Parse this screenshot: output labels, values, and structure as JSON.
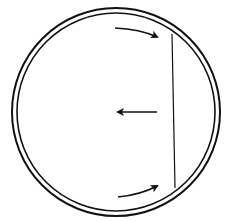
{
  "diagram": {
    "colors": {
      "stroke": "#111111",
      "background": "#ffffff"
    },
    "outer_circle": {
      "cx": 116,
      "cy": 112,
      "r": 104
    },
    "inner_circle": {
      "cx": 116,
      "cy": 112,
      "r": 99
    },
    "chord": {
      "x1": 172,
      "y1": 34,
      "x2": 175,
      "y2": 188
    },
    "arrows": [
      {
        "name": "upper-curved-arrow",
        "path": "M115 28 Q140 29 157 37"
      },
      {
        "name": "lower-curved-arrow",
        "path": "M118 197 Q140 195 157 186"
      },
      {
        "name": "center-left-arrow",
        "path": "M157 112 L118 112"
      }
    ]
  }
}
